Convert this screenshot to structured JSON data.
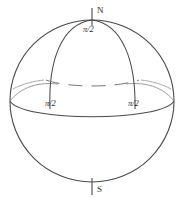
{
  "figure": {
    "type": "sphere-diagram",
    "background_color": "#ffffff",
    "stroke_color": "#3a3a3a",
    "label_color": "#2b2b2b"
  },
  "labels": {
    "north_pole": "N",
    "south_pole": "S",
    "top_angle": "π/2",
    "left_angle": "π/2",
    "right_angle": "π/2"
  },
  "geometry": {
    "sphere": {
      "center_x": 92,
      "center_y": 101,
      "radius_x": 82,
      "radius_y": 81
    },
    "axis": {
      "top_y": 8,
      "bottom_y": 195,
      "x": 92
    },
    "equator": {
      "left_x": 10,
      "right_x": 174,
      "y": 108,
      "bulge": 10
    },
    "latitude_dashed": {
      "y": 79,
      "left_x": 46,
      "right_x": 139
    },
    "meridian_left_base_x": 50,
    "meridian_right_base_x": 135
  }
}
